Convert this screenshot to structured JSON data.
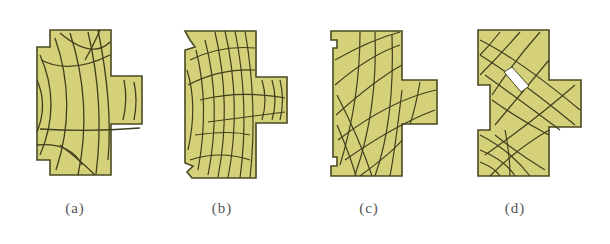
{
  "figure": {
    "colors": {
      "fill": "#d5d07a",
      "outline": "#4a4a22",
      "crack": "#3f3f1e",
      "hole": "#ffffff",
      "label": "#555555"
    },
    "panels": [
      {
        "id": "a",
        "label": "(a)"
      },
      {
        "id": "b",
        "label": "(b)"
      },
      {
        "id": "c",
        "label": "(c)"
      },
      {
        "id": "d",
        "label": "(d)"
      }
    ]
  }
}
